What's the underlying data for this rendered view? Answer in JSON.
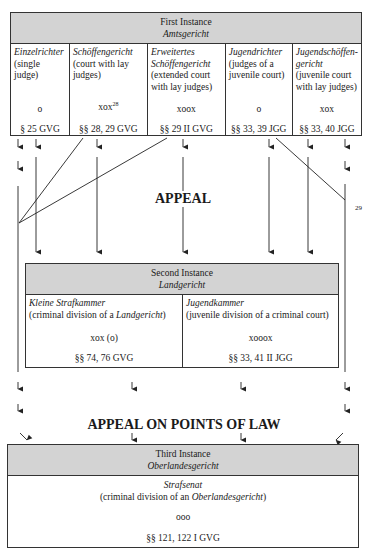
{
  "first_instance": {
    "title": "First Instance",
    "court": "Amtsgericht",
    "columns": [
      {
        "name": "Einzelrichter",
        "desc": "(single judge)",
        "desc_lines": [
          "(single",
          "judge)"
        ],
        "composition": "o",
        "footnote": "",
        "statute": "§ 25 GVG"
      },
      {
        "name": "Schöffengericht",
        "desc_lines": [
          "(court with lay",
          "judges)"
        ],
        "composition": "xox",
        "footnote": "28",
        "statute": "§§ 28, 29 GVG"
      },
      {
        "name_lines": [
          "Erweitertes",
          "Schöffengericht"
        ],
        "desc_lines": [
          "(extended court",
          "with lay judges)"
        ],
        "composition": "xoox",
        "footnote": "",
        "statute": "§§ 29 II GVG"
      },
      {
        "name": "Jugendrichter",
        "desc_lines": [
          "(judges of a",
          "juvenile court)"
        ],
        "composition": "o",
        "footnote": "",
        "statute": "§§ 33, 39 JGG"
      },
      {
        "name_lines": [
          "Jugendschöffen-",
          "gericht"
        ],
        "desc_lines": [
          "(juvenile court",
          "with lay judges)"
        ],
        "composition": "xox",
        "footnote": "",
        "statute": "§§ 33, 40 JGG"
      }
    ]
  },
  "appeal_label": "APPEAL",
  "appeal_footnote": "29",
  "second_instance": {
    "title": "Second Instance",
    "court": "Landgericht",
    "columns": [
      {
        "name": "Kleine Strafkammer",
        "desc_prefix": "(criminal division of a ",
        "desc_italic": "Landgericht",
        "desc_suffix": ")",
        "composition": "xox (o)",
        "statute": "§§ 74, 76 GVG"
      },
      {
        "name": "Jugendkammer",
        "desc_prefix": "(juvenile division of a criminal court)",
        "desc_italic": "",
        "desc_suffix": "",
        "composition": "xooox",
        "statute": "§§ 33, 41 II JGG"
      }
    ]
  },
  "appeal_law_label": "APPEAL ON POINTS OF LAW",
  "third_instance": {
    "title": "Third Instance",
    "court": "Oberlandesgericht",
    "body": {
      "name": "Strafsenat",
      "desc_prefix": "(criminal division of an ",
      "desc_italic": "Oberlandesgericht",
      "desc_suffix": ")",
      "composition": "ooo",
      "statute": "§§ 121, 122 I GVG"
    }
  },
  "colors": {
    "header_fill": "#d3d3d3",
    "border": "#333333",
    "line": "#222222"
  }
}
